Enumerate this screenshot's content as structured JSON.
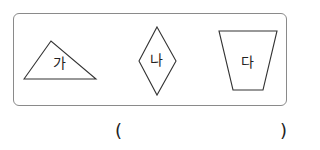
{
  "figure": {
    "shapes": [
      {
        "id": "ga",
        "label": "가",
        "type": "triangle"
      },
      {
        "id": "na",
        "label": "나",
        "type": "rhombus"
      },
      {
        "id": "da",
        "label": "다",
        "type": "trapezoid"
      }
    ],
    "stroke_color": "#333333",
    "box_border_color": "#8a8a8a"
  },
  "answer": {
    "open_paren": "(",
    "close_paren": ")",
    "value": ""
  }
}
